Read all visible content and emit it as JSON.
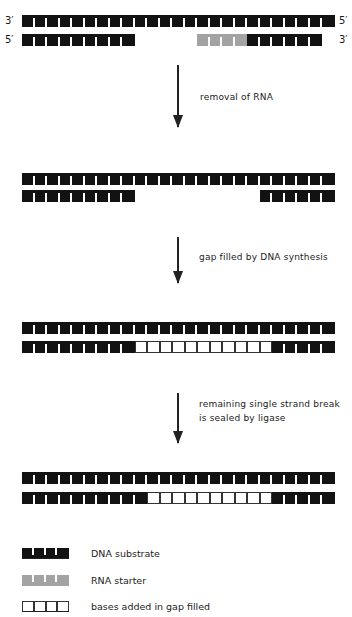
{
  "diagram": {
    "stage1": {
      "top_left_label": "3′",
      "top_right_label": "5′",
      "bottom_left_label": "5′",
      "bottom_right_label": "3′",
      "top_strand": "25 DNA blocks",
      "bottom_strand": "9 DNA blocks, gap of 5, 4 RNA blocks, 6 DNA blocks"
    },
    "steps": [
      {
        "label": "removal of RNA"
      },
      {
        "label": "gap filled by DNA synthesis"
      },
      {
        "label": "remaining single strand break\nis sealed by ligase"
      }
    ],
    "stage2": {
      "top_strand": "25 DNA blocks",
      "bottom_strand": "9 DNA blocks, gap of 10, 6 DNA blocks"
    },
    "stage3": {
      "top_strand": "25 DNA blocks",
      "bottom_strand": "9 DNA blocks, 11 open blocks, 5 DNA blocks"
    },
    "stage4": {
      "top_strand": "25 DNA blocks",
      "bottom_strand": "10 DNA blocks, 10 open blocks, 5 DNA blocks"
    },
    "colors": {
      "dna": "#121212",
      "rna": "#a3a3a3",
      "open_outline": "#333333"
    }
  },
  "legend": [
    {
      "symbol": "dna",
      "label": "DNA substrate"
    },
    {
      "symbol": "rna",
      "label": "RNA starter"
    },
    {
      "symbol": "open",
      "label": "bases added in gap filled"
    }
  ]
}
